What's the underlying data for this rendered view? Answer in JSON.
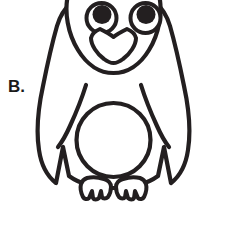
{
  "page": {
    "background_color": "#ffffff",
    "width": 227,
    "height": 230
  },
  "label": {
    "text": "B.",
    "color": "#1a1a1a"
  },
  "figure": {
    "name": "penguin",
    "style": "outline-line-art",
    "fill_color": "#ffffff",
    "stroke_color": "#231f20",
    "parts": [
      {
        "name": "body",
        "label": "body"
      },
      {
        "name": "head",
        "label": "head"
      },
      {
        "name": "head-notch",
        "label": "heart-shaped head notch"
      },
      {
        "name": "left-eye",
        "label": "left eye"
      },
      {
        "name": "right-eye",
        "label": "right eye"
      },
      {
        "name": "left-pupil",
        "label": "left pupil"
      },
      {
        "name": "right-pupil",
        "label": "right pupil"
      },
      {
        "name": "beak",
        "label": "beak"
      },
      {
        "name": "left-wing",
        "label": "left wing"
      },
      {
        "name": "right-wing",
        "label": "right wing"
      },
      {
        "name": "belly",
        "label": "belly"
      },
      {
        "name": "left-foot",
        "label": "left foot"
      },
      {
        "name": "right-foot",
        "label": "right foot"
      }
    ]
  }
}
